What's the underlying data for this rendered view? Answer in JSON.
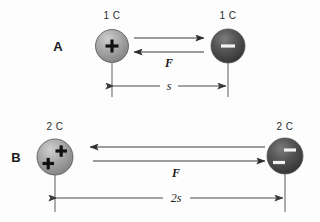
{
  "figure": {
    "type": "physics-diagram",
    "background_color": "#fdfdfd"
  },
  "rows": [
    {
      "letter": "A",
      "left_charge": {
        "label": "1 C",
        "sign": "+",
        "sign_count": 1,
        "fill": "#9a9a9a"
      },
      "right_charge": {
        "label": "1 C",
        "sign": "−",
        "sign_count": 1,
        "fill": "#4a4a4a"
      },
      "force_label": "F",
      "top_arrow_direction": "right",
      "bottom_arrow_direction": "left",
      "distance_label": "s"
    },
    {
      "letter": "B",
      "left_charge": {
        "label": "2 C",
        "sign": "+",
        "sign_count": 2,
        "fill": "#9a9a9a"
      },
      "right_charge": {
        "label": "2 C",
        "sign": "−",
        "sign_count": 2,
        "fill": "#4a4a4a"
      },
      "force_label": "F",
      "top_arrow_direction": "left",
      "bottom_arrow_direction": "right",
      "distance_label": "2s"
    }
  ],
  "colors": {
    "positive_sphere": "#9a9a9a",
    "negative_sphere": "#4a4a4a",
    "line": "#3a3a3a",
    "text": "#1a1a1a"
  }
}
